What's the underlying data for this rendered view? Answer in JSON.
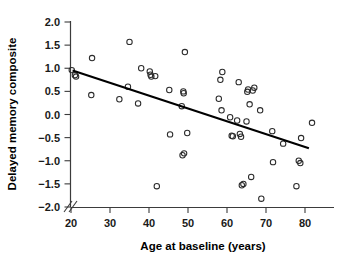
{
  "chart_data": {
    "type": "scatter",
    "title": "",
    "subtitle": "",
    "xlabel": "Age at baseline (years)",
    "ylabel": "Delayed memory composite",
    "xlim": [
      20,
      82.5
    ],
    "ylim": [
      -2.0,
      2.0
    ],
    "xticks": [
      20,
      30,
      40,
      50,
      60,
      70,
      80
    ],
    "xticklabels": [
      "20",
      "30",
      "40",
      "50",
      "60",
      "70",
      "80"
    ],
    "yticks": [
      -2.0,
      -1.5,
      -1.0,
      -0.5,
      0.0,
      0.5,
      1.0,
      1.5,
      2.0
    ],
    "yticklabels": [
      "-2.0",
      "-1.5",
      "-1.0",
      "-0.5",
      "0.0",
      "0.5",
      "1.0",
      "1.5",
      "2.0"
    ],
    "grid": false,
    "legend": false,
    "axis_break": true,
    "axis_break_axis": "x",
    "marker": "open-circle",
    "marker_color": "#2b2b2b",
    "series": [
      {
        "name": "participants",
        "points": [
          [
            20.2,
            0.96
          ],
          [
            21.0,
            0.85
          ],
          [
            21.3,
            0.82
          ],
          [
            25.4,
            1.22
          ],
          [
            25.2,
            0.42
          ],
          [
            32.4,
            0.33
          ],
          [
            34.6,
            0.6
          ],
          [
            35.0,
            1.57
          ],
          [
            37.2,
            0.24
          ],
          [
            38.0,
            1.0
          ],
          [
            40.2,
            0.93
          ],
          [
            40.4,
            0.86
          ],
          [
            40.6,
            0.82
          ],
          [
            41.6,
            0.83
          ],
          [
            42.0,
            -1.55
          ],
          [
            45.2,
            0.53
          ],
          [
            45.4,
            -0.43
          ],
          [
            48.4,
            0.18
          ],
          [
            48.6,
            -0.88
          ],
          [
            49.0,
            -0.84
          ],
          [
            48.8,
            0.5
          ],
          [
            48.9,
            0.46
          ],
          [
            49.2,
            1.35
          ],
          [
            49.8,
            -0.4
          ],
          [
            57.9,
            0.34
          ],
          [
            58.3,
            0.75
          ],
          [
            58.6,
            0.09
          ],
          [
            58.8,
            0.92
          ],
          [
            60.8,
            -0.06
          ],
          [
            61.2,
            -0.46
          ],
          [
            61.5,
            -0.47
          ],
          [
            62.6,
            -0.13
          ],
          [
            63.0,
            0.7
          ],
          [
            63.3,
            -0.42
          ],
          [
            63.6,
            -0.48
          ],
          [
            63.8,
            -1.53
          ],
          [
            64.2,
            -1.5
          ],
          [
            65.0,
            -0.15
          ],
          [
            65.2,
            0.49
          ],
          [
            65.4,
            0.54
          ],
          [
            65.8,
            0.22
          ],
          [
            66.2,
            -1.35
          ],
          [
            66.6,
            0.52
          ],
          [
            67.0,
            0.58
          ],
          [
            68.5,
            0.09
          ],
          [
            68.8,
            -1.82
          ],
          [
            71.6,
            -0.36
          ],
          [
            71.8,
            -1.03
          ],
          [
            74.4,
            -0.63
          ],
          [
            77.8,
            -1.55
          ],
          [
            78.4,
            -1.0
          ],
          [
            78.8,
            -1.05
          ],
          [
            79.0,
            -0.51
          ],
          [
            81.8,
            -0.18
          ]
        ]
      }
    ],
    "fit_line": {
      "name": "regression-line",
      "x0": 20.4,
      "y0": 0.95,
      "x1": 81.0,
      "y1": -0.73,
      "color": "#000000"
    }
  }
}
